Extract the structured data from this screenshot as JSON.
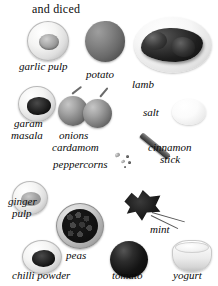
{
  "figure": {
    "heading": "and diced",
    "kind": "ingredient-photo-plate",
    "palette": "grayscale",
    "background": "#ffffff"
  },
  "labels": {
    "garlic_pulp": "garlic pulp",
    "potato": "potato",
    "lamb": "lamb",
    "garam_masala_line1": "garam",
    "garam_masala_line2": "masala",
    "onions": "onions",
    "salt": "salt",
    "cardamom": "cardamom",
    "peppercorns": "peppercorns",
    "cinnamon_line1": "cinnamon",
    "cinnamon_line2": "stick",
    "ginger_line1": "ginger",
    "ginger_line2": "pulp",
    "peas": "peas",
    "mint": "mint",
    "chilli_powder": "chilli powder",
    "tomato": "tomato",
    "yogurt": "yogurt"
  },
  "items": [
    {
      "name": "garlic-pulp",
      "label": "garlic pulp",
      "container": "glass bowl"
    },
    {
      "name": "potato",
      "label": "potato",
      "container": "whole vegetable"
    },
    {
      "name": "lamb",
      "label": "lamb",
      "container": "white plate"
    },
    {
      "name": "garam-masala",
      "label": "garam masala",
      "container": "glass bowl"
    },
    {
      "name": "onions",
      "label": "onions",
      "container": "two whole bulbs"
    },
    {
      "name": "salt",
      "label": "salt",
      "container": "small white dish"
    },
    {
      "name": "cardamom",
      "label": "cardamom",
      "container": "loose pods"
    },
    {
      "name": "peppercorns",
      "label": "peppercorns",
      "container": "loose seeds"
    },
    {
      "name": "cinnamon-stick",
      "label": "cinnamon stick",
      "container": "loose quill"
    },
    {
      "name": "ginger-pulp",
      "label": "ginger pulp",
      "container": "glass bowl"
    },
    {
      "name": "peas",
      "label": "peas",
      "container": "bowl"
    },
    {
      "name": "mint",
      "label": "mint",
      "container": "fresh sprig"
    },
    {
      "name": "chilli-powder",
      "label": "chilli powder",
      "container": "glass bowl"
    },
    {
      "name": "tomato",
      "label": "tomato",
      "container": "whole fruit"
    },
    {
      "name": "yogurt",
      "label": "yogurt",
      "container": "tub"
    }
  ]
}
